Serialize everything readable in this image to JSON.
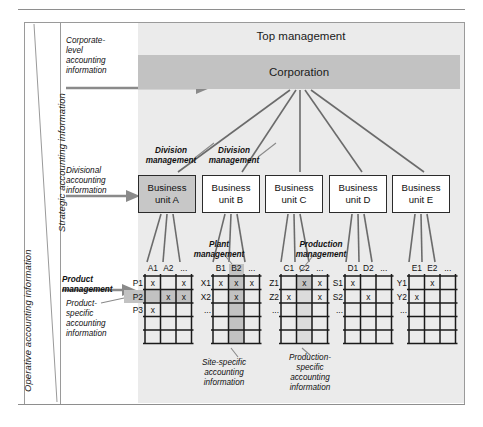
{
  "axis_labels": {
    "strategic": "Strategic accounting information",
    "operative": "Operative accounting information"
  },
  "hierarchy": {
    "top_management_label": "Top management",
    "corporation_label": "Corporation",
    "division_management_label_1": "Division",
    "division_management_label_2": "management",
    "division_management_label_3": "Division",
    "division_management_label_4": "management",
    "plant_management_line1": "Plant",
    "plant_management_line2": "management",
    "production_management_line1": "Production",
    "production_management_line2": "management",
    "product_management_line1": "Product",
    "product_management_line2": "management"
  },
  "units": [
    {
      "line1": "Business",
      "line2": "unit A",
      "highlight": true
    },
    {
      "line1": "Business",
      "line2": "unit B",
      "highlight": false
    },
    {
      "line1": "Business",
      "line2": "unit C",
      "highlight": false
    },
    {
      "line1": "Business",
      "line2": "unit D",
      "highlight": false
    },
    {
      "line1": "Business",
      "line2": "unit E",
      "highlight": false
    }
  ],
  "info_notes": {
    "corporate_level": "Corporate-\nlevel\naccounting\ninformation",
    "corporate_level_l1": "Corporate-",
    "corporate_level_l2": "level",
    "corporate_level_l3": "accounting",
    "corporate_level_l4": "information",
    "divisional_l1": "Divisional",
    "divisional_l2": "accounting",
    "divisional_l3": "information",
    "product_specific_l1": "Product-",
    "product_specific_l2": "specific",
    "product_specific_l3": "accounting",
    "product_specific_l4": "information",
    "site_specific_l1": "Site-specific",
    "site_specific_l2": "accounting",
    "site_specific_l3": "information",
    "production_specific_l1": "Production-",
    "production_specific_l2": "specific",
    "production_specific_l3": "accounting",
    "production_specific_l4": "information"
  },
  "matrices": [
    {
      "id": "A",
      "columns": [
        "A1",
        "A2",
        "..."
      ],
      "rows": [
        "P1",
        "P2",
        "P3"
      ],
      "marks": [
        [
          1,
          0,
          1
        ],
        [
          0,
          1,
          1
        ],
        [
          1,
          0,
          0
        ]
      ],
      "mark_symbol": "x",
      "highlight_row_index": 1
    },
    {
      "id": "B",
      "columns": [
        "B1",
        "B2",
        "..."
      ],
      "rows": [
        "X1",
        "X2",
        "..."
      ],
      "marks": [
        [
          1,
          1,
          1
        ],
        [
          0,
          1,
          0
        ],
        [
          0,
          0,
          0
        ]
      ],
      "mark_symbol": "x",
      "highlight_col_index": 1
    },
    {
      "id": "C",
      "columns": [
        "C1",
        "C2",
        "..."
      ],
      "rows": [
        "Z1",
        "Z2",
        "..."
      ],
      "marks": [
        [
          0,
          1,
          1
        ],
        [
          1,
          0,
          1
        ],
        [
          0,
          0,
          0
        ]
      ],
      "mark_symbol": "x",
      "highlight_cell": [
        0,
        1
      ]
    },
    {
      "id": "D",
      "columns": [
        "D1",
        "D2",
        "..."
      ],
      "rows": [
        "S1",
        "S2",
        "..."
      ],
      "marks": [
        [
          1,
          0,
          0
        ],
        [
          0,
          1,
          0
        ],
        [
          0,
          0,
          0
        ]
      ],
      "mark_symbol": "x"
    },
    {
      "id": "E",
      "columns": [
        "E1",
        "E2",
        "..."
      ],
      "rows": [
        "Y1",
        "Y2",
        "..."
      ],
      "marks": [
        [
          0,
          1,
          0
        ],
        [
          1,
          0,
          0
        ],
        [
          0,
          0,
          0
        ]
      ],
      "mark_symbol": "x"
    }
  ],
  "colors": {
    "band": "#ebebeb",
    "corporation_bar": "#c2c2c2",
    "unit_highlight": "#c7c7c7",
    "cell_highlight": "#c2c2c2",
    "line": "#6b6b6b",
    "border": "#2b2b2b"
  }
}
